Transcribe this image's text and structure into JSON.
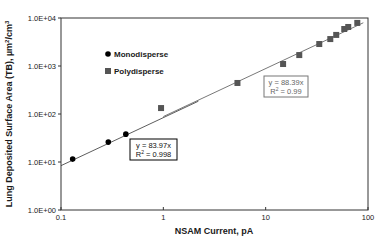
{
  "chart_data": {
    "type": "scatter",
    "title": "",
    "xlabel": "NSAM Current, pA",
    "ylabel": "Lung Deposited Surface Area (TB), µm²/cm³",
    "ylabel_parts": {
      "main": "Lung Deposited Surface Area (TB), µm",
      "sup1": "2",
      "mid": "/cm",
      "sup2": "3"
    },
    "xscale": "log",
    "yscale": "log",
    "xlim": [
      0.1,
      100
    ],
    "ylim": [
      1,
      10000
    ],
    "x_ticks": [
      0.1,
      1,
      10,
      100
    ],
    "x_tick_labels": [
      "0.1",
      "1",
      "10",
      "100"
    ],
    "y_ticks": [
      1,
      10,
      100,
      1000,
      10000
    ],
    "y_tick_labels": [
      "1.0E+00",
      "1.0E+01",
      "1.0E+02",
      "1.0E+03",
      "1.0E+04"
    ],
    "grid": false,
    "legend_position": "upper-left",
    "series": [
      {
        "name": "Monodisperse",
        "marker": "circle",
        "color": "#000000",
        "x": [
          0.13,
          0.29,
          0.43
        ],
        "y": [
          11.5,
          26,
          38
        ],
        "fit": {
          "slope": 83.97,
          "equation": "y = 83.97x",
          "r2_label": "R",
          "r2_value": " = 0.998",
          "box_color": "#000000"
        }
      },
      {
        "name": "Polydisperse",
        "marker": "square",
        "color": "#555555",
        "x": [
          0.95,
          5.3,
          14.8,
          21.3,
          33.4,
          42.8,
          48.9,
          58.6,
          64.1,
          78.6
        ],
        "y": [
          133,
          443,
          1100,
          1690,
          2870,
          3640,
          4440,
          5900,
          6500,
          7900
        ],
        "fit": {
          "slope": 88.39,
          "equation": "y = 88.39x",
          "r2_label": "R",
          "r2_value": " = 0.99",
          "box_color": "#6a6a6a"
        }
      }
    ]
  }
}
